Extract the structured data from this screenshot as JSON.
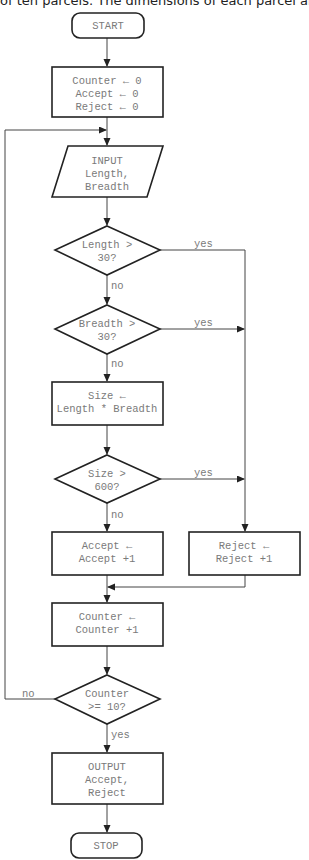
{
  "caption": "of ten parcels. The dimensions of each parcel are in",
  "flowchart": {
    "start": "START",
    "init": [
      "Counter ← 0",
      "Accept ← 0",
      "Reject ← 0"
    ],
    "input": [
      "INPUT",
      "Length,",
      "Breadth"
    ],
    "decision_length": [
      "Length >",
      "30?"
    ],
    "decision_breadth": [
      "Breadth >",
      "30?"
    ],
    "size_calc": [
      "Size ←",
      "Length * Breadth"
    ],
    "decision_size": [
      "Size >",
      "600?"
    ],
    "accept_inc": [
      "Accept ←",
      "Accept +1"
    ],
    "reject_inc": [
      "Reject ←",
      "Reject +1"
    ],
    "counter_inc": [
      "Counter ←",
      "Counter +1"
    ],
    "decision_counter": [
      "Counter",
      ">= 10?"
    ],
    "output": [
      "OUTPUT",
      "Accept,",
      "Reject"
    ],
    "stop": "STOP",
    "labels": {
      "yes": "yes",
      "no": "no"
    }
  }
}
